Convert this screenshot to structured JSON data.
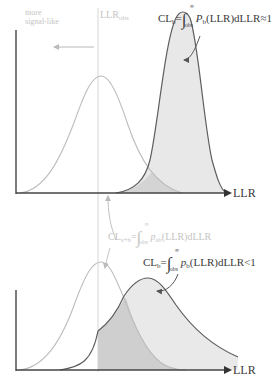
{
  "figure": {
    "top_panel": {
      "annotation_more_signal": [
        "more",
        "signal-like"
      ],
      "obs_label_main": "LLR",
      "obs_label_sub": "obs",
      "formula": {
        "lhs_main": "CL",
        "lhs_sub": "b",
        "eq": "=",
        "integral": "∫",
        "upper": "∞",
        "lower": "obs",
        "integrand_main": "P",
        "integrand_sub": "b",
        "rest": "(LLR)dLLR≈1"
      },
      "axis_label": "LLR"
    },
    "bottom_panel": {
      "formula_sb": {
        "lhs_main": "CL",
        "lhs_sub": "s+b",
        "eq": "=",
        "integral": "∫",
        "upper": "∞",
        "lower": "obs",
        "integrand_main": "p",
        "integrand_sub": "sb",
        "rest": "(LLR)dLLR"
      },
      "formula_b": {
        "lhs_main": "CL",
        "lhs_sub": "b",
        "eq": "=",
        "integral": "∫",
        "upper": "∞",
        "lower": "obs",
        "integrand_main": "p",
        "integrand_sub": "b",
        "rest": "(LLR)dLLR<1"
      },
      "axis_label": "LLR"
    },
    "colors": {
      "axis": "#555555",
      "signal_curve": "#bdbdbd",
      "background_curve": "#5e5e5e",
      "fill_background": "#e8e8e8",
      "fill_overlap": "#d2d2d2",
      "obs_line": "#d6d6d6",
      "faint_text": "#c4c4c4",
      "dark_text": "#3a3a3a"
    }
  }
}
